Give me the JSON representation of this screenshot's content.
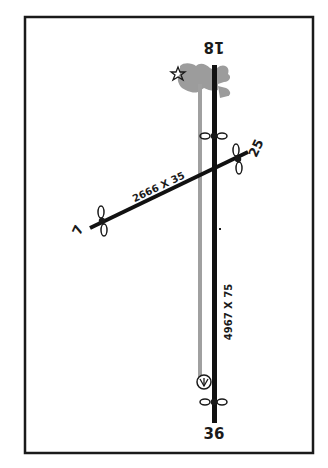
{
  "diagram": {
    "type": "airport-runway-diagram",
    "frame": {
      "stroke": "#1a1a1a"
    },
    "runways": [
      {
        "id": "18-36",
        "ends": {
          "north": "18",
          "south": "36"
        },
        "dimensions": "4967 X 75",
        "color": "#111111"
      },
      {
        "id": "7-25",
        "ends": {
          "west": "7",
          "east": "25"
        },
        "dimensions": "2666 X 35",
        "color": "#111111"
      }
    ],
    "taxiway": {
      "color": "#9a9a9a"
    },
    "ramp_area": {
      "color": "#9c9c9c"
    },
    "symbols": {
      "beacon": "star-icon",
      "wind_indicator": "wind-cone-icon",
      "runway_end_lights": "runway-end-lights-icon"
    }
  }
}
